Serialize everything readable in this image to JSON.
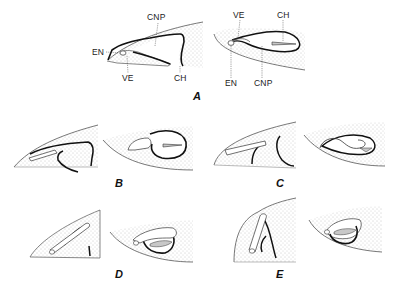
{
  "figure": {
    "panels": [
      {
        "id": "A",
        "label": "A",
        "x": 193,
        "y": 91
      },
      {
        "id": "B",
        "label": "B",
        "x": 115,
        "y": 178
      },
      {
        "id": "C",
        "label": "C",
        "x": 276,
        "y": 178
      },
      {
        "id": "D",
        "label": "D",
        "x": 115,
        "y": 269
      },
      {
        "id": "E",
        "label": "E",
        "x": 276,
        "y": 269
      }
    ],
    "annotations_a_left": {
      "cnp": "CNP",
      "en": "EN",
      "ve": "VE",
      "ch": "CH"
    },
    "annotations_a_right": {
      "ve": "VE",
      "ch": "CH",
      "en": "EN",
      "cnp": "CNP"
    },
    "colors": {
      "outline": "#1a1a1a",
      "stipple": "#9a9a9a",
      "shade": "#c8c8c8",
      "background": "#ffffff"
    }
  }
}
